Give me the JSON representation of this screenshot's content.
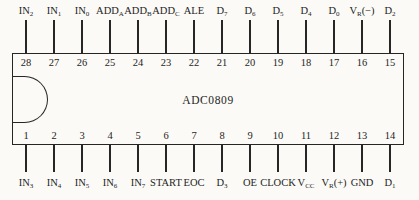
{
  "diagram": {
    "chip_name": "ADC0809",
    "line_color": "#262626",
    "background": "#fbfaf6"
  },
  "top_pins": [
    {
      "number": "28",
      "base": "IN",
      "sub": "2",
      "suffix": ""
    },
    {
      "number": "27",
      "base": "IN",
      "sub": "1",
      "suffix": ""
    },
    {
      "number": "26",
      "base": "IN",
      "sub": "0",
      "suffix": ""
    },
    {
      "number": "25",
      "base": "ADD",
      "sub": "A",
      "suffix": ""
    },
    {
      "number": "24",
      "base": "ADD",
      "sub": "B",
      "suffix": ""
    },
    {
      "number": "23",
      "base": "ADD",
      "sub": "C",
      "suffix": ""
    },
    {
      "number": "22",
      "base": "ALE",
      "sub": "",
      "suffix": ""
    },
    {
      "number": "21",
      "base": "D",
      "sub": "7",
      "suffix": ""
    },
    {
      "number": "20",
      "base": "D",
      "sub": "6",
      "suffix": ""
    },
    {
      "number": "19",
      "base": "D",
      "sub": "5",
      "suffix": ""
    },
    {
      "number": "18",
      "base": "D",
      "sub": "4",
      "suffix": ""
    },
    {
      "number": "17",
      "base": "D",
      "sub": "0",
      "suffix": ""
    },
    {
      "number": "16",
      "base": "V",
      "sub": "R",
      "suffix": "(−)"
    },
    {
      "number": "15",
      "base": "D",
      "sub": "2",
      "suffix": ""
    }
  ],
  "bottom_pins": [
    {
      "number": "1",
      "base": "IN",
      "sub": "3",
      "suffix": ""
    },
    {
      "number": "2",
      "base": "IN",
      "sub": "4",
      "suffix": ""
    },
    {
      "number": "3",
      "base": "IN",
      "sub": "5",
      "suffix": ""
    },
    {
      "number": "4",
      "base": "IN",
      "sub": "6",
      "suffix": ""
    },
    {
      "number": "5",
      "base": "IN",
      "sub": "7",
      "suffix": ""
    },
    {
      "number": "6",
      "base": "START",
      "sub": "",
      "suffix": ""
    },
    {
      "number": "7",
      "base": "EOC",
      "sub": "",
      "suffix": ""
    },
    {
      "number": "8",
      "base": "D",
      "sub": "3",
      "suffix": ""
    },
    {
      "number": "9",
      "base": "OE",
      "sub": "",
      "suffix": ""
    },
    {
      "number": "10",
      "base": "CLOCK",
      "sub": "",
      "suffix": ""
    },
    {
      "number": "11",
      "base": "V",
      "sub": "CC",
      "suffix": ""
    },
    {
      "number": "12",
      "base": "V",
      "sub": "R",
      "suffix": "(+)"
    },
    {
      "number": "13",
      "base": "GND",
      "sub": "",
      "suffix": ""
    },
    {
      "number": "14",
      "base": "D",
      "sub": "1",
      "suffix": ""
    }
  ]
}
